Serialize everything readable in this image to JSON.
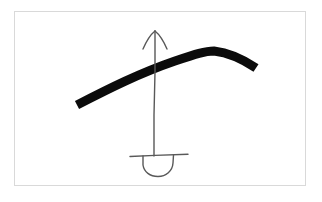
{
  "figure": {
    "title": "Hand-drawn arc with upward arrow and bowl",
    "caption": "",
    "background_color": "#ffffff",
    "frame": {
      "name": "image-frame",
      "x": 14,
      "y": 11,
      "width": 292,
      "height": 175,
      "border_color": "#d9d9d9",
      "border_width": 1,
      "fill_color": "#ffffff"
    },
    "ink": {
      "thick_stroke_color": "#0b0b0b",
      "thin_stroke_color": "#595959"
    }
  },
  "chart_data": {
    "type": "line",
    "title": "Hand-drawn arc with upward arrow and bowl",
    "xlabel": "",
    "ylabel": "",
    "xlim": [
      14,
      306
    ],
    "ylim": [
      11,
      186
    ],
    "grid": false,
    "legend": "none",
    "series": [
      {
        "name": "thick-arc",
        "role": "hill-curve",
        "style": "thick-solid",
        "color": "#0b0b0b",
        "stroke_width": 9,
        "points": [
          [
            77,
            105
          ],
          [
            100,
            93
          ],
          [
            125,
            81
          ],
          [
            150,
            70
          ],
          [
            175,
            61
          ],
          [
            196,
            54
          ],
          [
            212,
            51
          ],
          [
            230,
            54
          ],
          [
            245,
            61
          ],
          [
            256,
            68
          ]
        ]
      },
      {
        "name": "arrow-shaft",
        "role": "vertical-arrow",
        "style": "thin-solid",
        "color": "#595959",
        "stroke_width": 1.4,
        "points": [
          [
            155,
            31
          ],
          [
            155,
            70
          ],
          [
            155,
            110
          ],
          [
            154,
            140
          ],
          [
            154,
            156
          ]
        ]
      },
      {
        "name": "arrow-head-left-barb",
        "role": "arrowhead",
        "style": "thin-solid",
        "color": "#595959",
        "stroke_width": 1.4,
        "points": [
          [
            143,
            48
          ],
          [
            148,
            38
          ],
          [
            155,
            31
          ]
        ]
      },
      {
        "name": "arrow-head-right-barb",
        "role": "arrowhead",
        "style": "thin-solid",
        "color": "#595959",
        "stroke_width": 1.4,
        "points": [
          [
            155,
            31
          ],
          [
            162,
            38
          ],
          [
            167,
            48
          ]
        ]
      },
      {
        "name": "horizontal-bar",
        "role": "bowl-rim",
        "style": "thin-solid",
        "color": "#595959",
        "stroke_width": 1.4,
        "points": [
          [
            130,
            156
          ],
          [
            155,
            155
          ],
          [
            188,
            154
          ]
        ]
      },
      {
        "name": "bowl-arc",
        "role": "semicircular-bowl",
        "style": "thin-solid",
        "color": "#595959",
        "stroke_width": 1.4,
        "points": [
          [
            143,
            156
          ],
          [
            143,
            165
          ],
          [
            148,
            173
          ],
          [
            158,
            176
          ],
          [
            168,
            172
          ],
          [
            173,
            164
          ],
          [
            173,
            155
          ]
        ]
      }
    ],
    "annotations": []
  }
}
